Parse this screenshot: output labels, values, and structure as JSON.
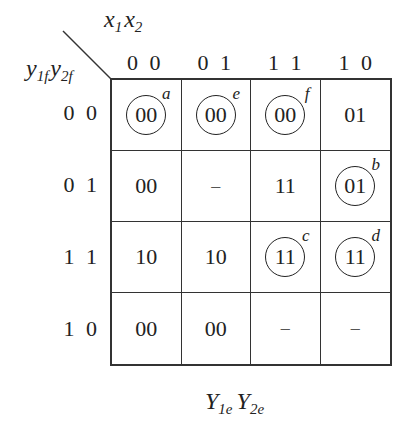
{
  "diagram": {
    "col_variables": {
      "base1": "x",
      "sub1": "1",
      "base2": "x",
      "sub2": "2"
    },
    "row_variables": {
      "base1": "y",
      "sub1": "1f",
      "base2": "y",
      "sub2": "2f"
    },
    "col_headers": [
      "0 0",
      "0 1",
      "1 1",
      "1 0"
    ],
    "row_headers": [
      "0 0",
      "0 1",
      "1 1",
      "1 0"
    ],
    "cells": [
      [
        {
          "value": "00",
          "circled": true,
          "tag": "a"
        },
        {
          "value": "00",
          "circled": true,
          "tag": "e"
        },
        {
          "value": "00",
          "circled": true,
          "tag": "f"
        },
        {
          "value": "01",
          "circled": false,
          "tag": ""
        }
      ],
      [
        {
          "value": "00",
          "circled": false,
          "tag": ""
        },
        {
          "value": "–",
          "circled": false,
          "tag": ""
        },
        {
          "value": "11",
          "circled": false,
          "tag": ""
        },
        {
          "value": "01",
          "circled": true,
          "tag": "b"
        }
      ],
      [
        {
          "value": "10",
          "circled": false,
          "tag": ""
        },
        {
          "value": "10",
          "circled": false,
          "tag": ""
        },
        {
          "value": "11",
          "circled": true,
          "tag": "c"
        },
        {
          "value": "11",
          "circled": true,
          "tag": "d"
        }
      ],
      [
        {
          "value": "00",
          "circled": false,
          "tag": ""
        },
        {
          "value": "00",
          "circled": false,
          "tag": ""
        },
        {
          "value": "–",
          "circled": false,
          "tag": ""
        },
        {
          "value": "–",
          "circled": false,
          "tag": ""
        }
      ]
    ],
    "footer": {
      "base1": "Y",
      "sub1": "1e",
      "base2": "Y",
      "sub2": "2e"
    }
  }
}
